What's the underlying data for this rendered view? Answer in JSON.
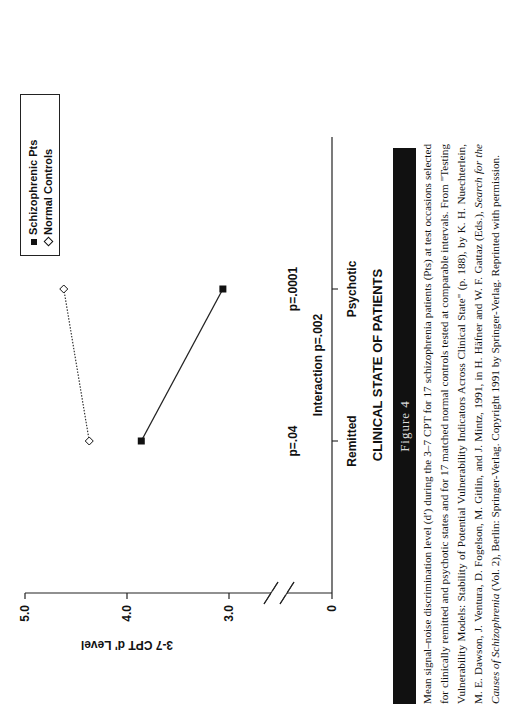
{
  "figure_label": "Figure 4",
  "caption": {
    "lines": [
      "Mean signal–noise discrimination level (d′) during the 3–7 CPT for 17 schizophrenia patients (Pts) at test occasions selected",
      "for clinically remitted and psychotic states and for 17 matched normal controls tested at comparable intervals. From \"Testing",
      "Vulnerability Models: Stability of Potential Vulnerability Indicators Across Clinical State\" (p. 188), by K. H. Nuechterlein, M. E.",
      "Dawson, J. Ventura, D. Fogelson, M. Gitlin, and J. Mintz, 1991, in H. Häfner and W. F. Gattaz (Eds.), ",
      "(Vol. 2), Berlin: Springer-Verlag. Copyright 1991 by Springer-Verlag. Reprinted with permission."
    ],
    "italic_book_title_part1": "Search for the Causes of",
    "italic_book_title_part2": "Schizophrenia"
  },
  "chart_data": {
    "type": "line",
    "title": "",
    "xlabel": "CLINICAL STATE OF PATIENTS",
    "ylabel": "3-7 CPT d' Level",
    "categories": [
      "Remitted",
      "Psychotic"
    ],
    "yticks": [
      "0",
      "3.0",
      "4.0",
      "5.0"
    ],
    "ylim": [
      0,
      5.0
    ],
    "axis_break": "between 0 and 3.0",
    "series": [
      {
        "name": "Schizophrenic Pts",
        "marker": "filled-square",
        "line": "solid",
        "values": [
          3.86,
          3.06
        ]
      },
      {
        "name": "Normal Controls",
        "marker": "open-diamond",
        "line": "dotted",
        "values": [
          4.37,
          4.62
        ]
      }
    ],
    "annotations": [
      {
        "text": "p=.04",
        "category": "Remitted"
      },
      {
        "text": "p=.0001",
        "category": "Psychotic"
      },
      {
        "text": "Interaction p=.002",
        "category": "center"
      }
    ],
    "legend": {
      "position": "top-right",
      "entries": [
        "Schizophrenic Pts",
        "Normal Controls"
      ]
    },
    "grid": false
  }
}
